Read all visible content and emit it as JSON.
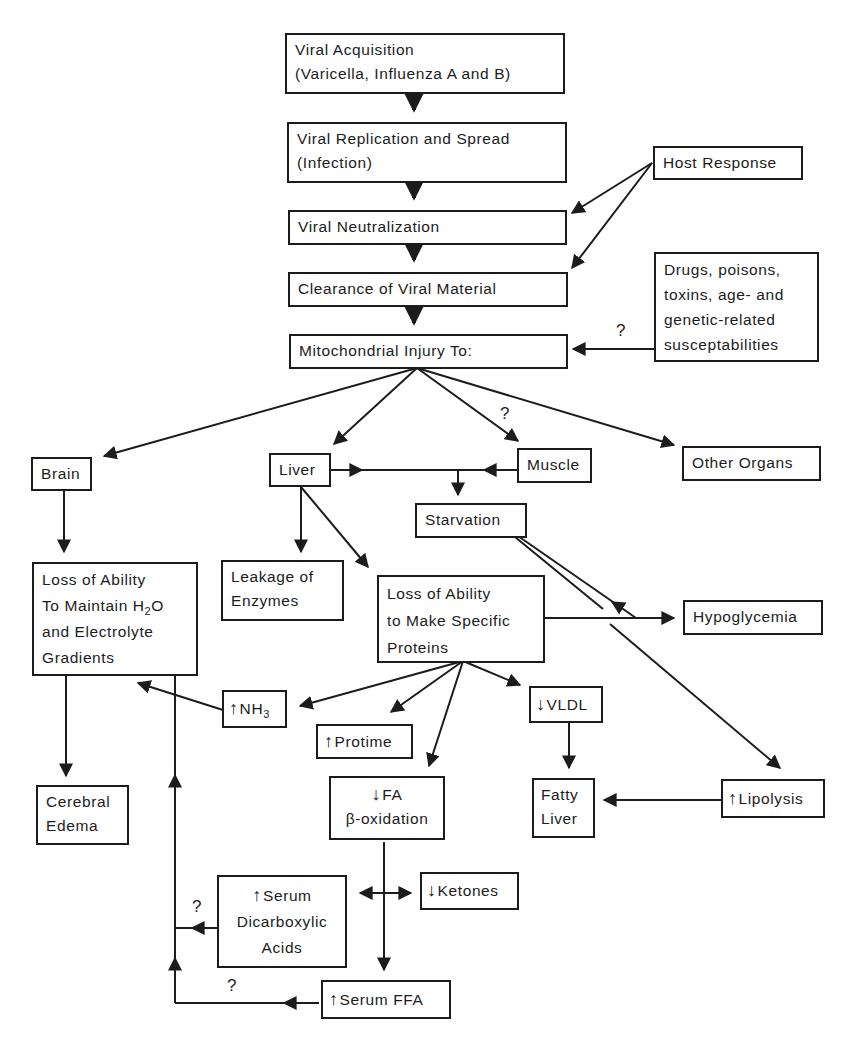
{
  "diagram": {
    "nodes": {
      "viral_acquisition": {
        "lines": [
          "Viral Acquisition",
          "(Varicella, Influenza A and B)"
        ]
      },
      "viral_replication": {
        "lines": [
          "Viral Replication and Spread",
          "(Infection)"
        ]
      },
      "viral_neutralization": {
        "lines": [
          "Viral Neutralization"
        ]
      },
      "clearance": {
        "lines": [
          "Clearance of Viral Material"
        ]
      },
      "mitochondrial_injury": {
        "lines": [
          "Mitochondrial Injury To:"
        ]
      },
      "host_response": {
        "lines": [
          "Host Response"
        ]
      },
      "drugs": {
        "lines": [
          "Drugs, poisons,",
          "toxins, age- and",
          "genetic-related",
          "susceptabilities"
        ]
      },
      "brain": {
        "lines": [
          "Brain"
        ]
      },
      "liver": {
        "lines": [
          "Liver"
        ]
      },
      "muscle": {
        "lines": [
          "Muscle"
        ]
      },
      "other_organs": {
        "lines": [
          "Other Organs"
        ]
      },
      "starvation": {
        "lines": [
          "Starvation"
        ]
      },
      "loss_h2o": {
        "lines": [
          "Loss of Ability",
          "To Maintain H",
          "and Electrolyte",
          "Gradients"
        ],
        "subscript": "2",
        "suffix": "O"
      },
      "leakage": {
        "lines": [
          "Leakage of",
          "Enzymes"
        ]
      },
      "loss_proteins": {
        "lines": [
          "Loss of Ability",
          "to Make Specific",
          "Proteins"
        ]
      },
      "hypoglycemia": {
        "lines": [
          "Hypoglycemia"
        ]
      },
      "nh3": {
        "direction": "up",
        "label": "NH",
        "subscript": "3"
      },
      "protime": {
        "direction": "up",
        "label": "Protime"
      },
      "vldl": {
        "direction": "down",
        "label": "VLDL"
      },
      "cerebral_edema": {
        "lines": [
          "Cerebral",
          "Edema"
        ]
      },
      "fa_oxidation": {
        "direction": "down",
        "label": "FA",
        "line2": "β-oxidation"
      },
      "fatty_liver": {
        "lines": [
          "Fatty",
          "Liver"
        ]
      },
      "lipolysis": {
        "direction": "up",
        "label": "Lipolysis"
      },
      "serum_dicarboxylic": {
        "direction": "up",
        "label": "Serum",
        "line2": "Dicarboxylic",
        "line3": "Acids"
      },
      "ketones": {
        "direction": "down",
        "label": "Ketones"
      },
      "serum_ffa": {
        "direction": "up",
        "label": "Serum FFA"
      }
    },
    "question_marks": {
      "drugs_to_mito": "?",
      "mito_to_muscle": "?",
      "dicarboxylic_to_loop": "?",
      "ffa_to_loop": "?"
    },
    "glyphs": {
      "up_arrow": "↑",
      "down_arrow": "↓"
    },
    "colors": {
      "ink": "#1c1c1c",
      "background": "#ffffff"
    }
  }
}
